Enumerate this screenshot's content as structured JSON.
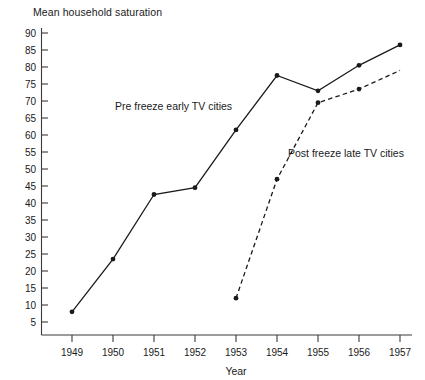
{
  "chart_data": {
    "type": "line",
    "title": "Mean household saturation",
    "subtitle": "",
    "xlabel": "Year",
    "ylabel": "",
    "x": [
      1949,
      1950,
      1951,
      1952,
      1953,
      1954,
      1955,
      1956,
      1957
    ],
    "categories": [
      "1949",
      "1950",
      "1951",
      "1952",
      "1953",
      "1954",
      "1955",
      "1956",
      "1957"
    ],
    "xlim": [
      1948.5,
      1957.5
    ],
    "ylim": [
      0,
      92
    ],
    "yticks": [
      90,
      85,
      80,
      75,
      70,
      65,
      60,
      55,
      50,
      45,
      40,
      35,
      30,
      25,
      20,
      15,
      10,
      5
    ],
    "ytick_labels": [
      "90",
      "85",
      "80",
      "75",
      "70",
      "65",
      "60",
      "55",
      "50",
      "45",
      "40",
      "35",
      "30",
      "25",
      "20",
      "15",
      "10",
      "5"
    ],
    "grid": false,
    "legend_position": "inline-annotation",
    "series": [
      {
        "name": "Pre freeze early TV cities",
        "style": "solid",
        "marker": "dot",
        "x": [
          1949,
          1950,
          1951,
          1952,
          1953,
          1954,
          1955,
          1956,
          1957
        ],
        "values": [
          8,
          23.5,
          42.5,
          44.5,
          61.5,
          77.5,
          73,
          80.5,
          86.5
        ]
      },
      {
        "name": "Post freeze late TV cities",
        "style": "dashed",
        "marker": "dot",
        "x": [
          1953,
          1954,
          1955,
          1956,
          1957
        ],
        "values": [
          12,
          47,
          69.5,
          73.5,
          79
        ]
      }
    ],
    "annotations": [
      {
        "text": "Pre freeze early TV cities",
        "x_px": 115,
        "y_px": 110
      },
      {
        "text": "Post freeze late TV cities",
        "x_px": 288,
        "y_px": 157
      }
    ]
  }
}
